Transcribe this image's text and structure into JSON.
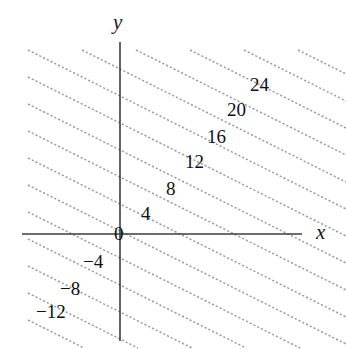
{
  "figure": {
    "kind": "contour-plot",
    "background_color": "#ffffff",
    "axis_color": "#3d3d3d",
    "contour_color": "#9aa0a6",
    "label_color": "#111111"
  },
  "axes": {
    "x_label": "x",
    "y_label": "y",
    "origin_label": "0",
    "x_axis_pixel": {
      "x1": 22,
      "x2": 302,
      "y": 234
    },
    "y_axis_pixel": {
      "y1": 42,
      "y2": 341,
      "x": 120
    }
  },
  "chart_data": {
    "type": "line",
    "title": "",
    "xlabel": "x",
    "ylabel": "y",
    "grid": false,
    "legend": "none",
    "contour_interval": 4,
    "contour_slope": -0.5,
    "levels": [
      {
        "label": "24",
        "value": 24,
        "label_x": 250,
        "label_y": 75
      },
      {
        "label": "20",
        "value": 20,
        "label_x": 227,
        "label_y": 100
      },
      {
        "label": "16",
        "value": 16,
        "label_x": 207,
        "label_y": 127
      },
      {
        "label": "12",
        "value": 12,
        "label_x": 185,
        "label_y": 152
      },
      {
        "label": "8",
        "value": 8,
        "label_x": 166,
        "label_y": 179
      },
      {
        "label": "4",
        "value": 4,
        "label_x": 141,
        "label_y": 204
      },
      {
        "label": "0",
        "value": 0,
        "label_x": 114,
        "label_y": 224
      },
      {
        "label": "−4",
        "value": -4,
        "label_x": 83,
        "label_y": 252
      },
      {
        "label": "−8",
        "value": -8,
        "label_x": 60,
        "label_y": 279
      },
      {
        "label": "−12",
        "value": -12,
        "label_x": 36,
        "label_y": 302
      }
    ],
    "contour_lines_pixel": [
      {
        "x1": 28,
        "y1": 50,
        "x2": 346,
        "y2": 209
      },
      {
        "x1": 28,
        "y1": 77,
        "x2": 346,
        "y2": 236
      },
      {
        "x1": 28,
        "y1": 104,
        "x2": 346,
        "y2": 263
      },
      {
        "x1": 28,
        "y1": 131,
        "x2": 346,
        "y2": 290
      },
      {
        "x1": 28,
        "y1": 158,
        "x2": 346,
        "y2": 317
      },
      {
        "x1": 28,
        "y1": 185,
        "x2": 346,
        "y2": 344
      },
      {
        "x1": 28,
        "y1": 212,
        "x2": 300,
        "y2": 348
      },
      {
        "x1": 28,
        "y1": 239,
        "x2": 246,
        "y2": 348
      },
      {
        "x1": 28,
        "y1": 266,
        "x2": 192,
        "y2": 348
      },
      {
        "x1": 28,
        "y1": 293,
        "x2": 138,
        "y2": 348
      },
      {
        "x1": 28,
        "y1": 320,
        "x2": 84,
        "y2": 348
      },
      {
        "x1": 82,
        "y1": 50,
        "x2": 346,
        "y2": 182
      },
      {
        "x1": 136,
        "y1": 50,
        "x2": 346,
        "y2": 155
      },
      {
        "x1": 190,
        "y1": 50,
        "x2": 346,
        "y2": 128
      },
      {
        "x1": 244,
        "y1": 50,
        "x2": 346,
        "y2": 101
      },
      {
        "x1": 298,
        "y1": 50,
        "x2": 346,
        "y2": 74
      }
    ],
    "xlim": [
      -10,
      12
    ],
    "ylim": [
      -13,
      27
    ]
  }
}
